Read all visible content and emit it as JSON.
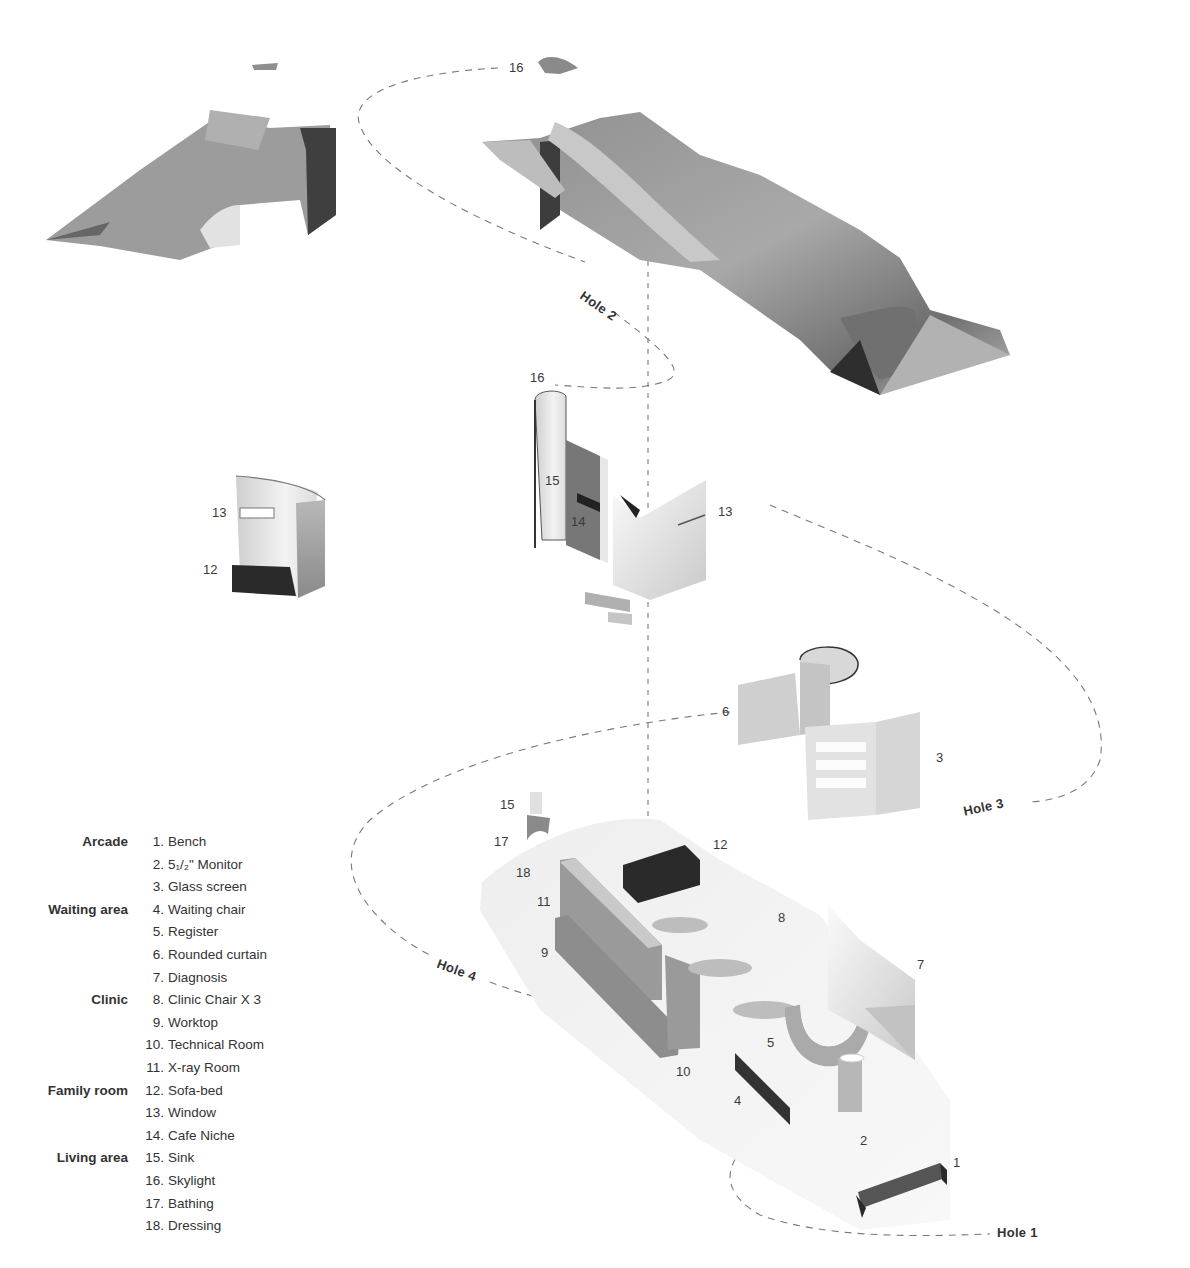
{
  "diagram": {
    "type": "exploded axonometric architectural diagram",
    "colors": {
      "background": "#ffffff",
      "surface_mid": "#9a9a9a",
      "surface_dark": "#3a3a3a",
      "surface_light": "#d8d8d8",
      "floor_light": "#eeeeee",
      "dash_line": "#777777",
      "text": "#333333"
    },
    "holes": [
      {
        "id": "hole1",
        "label": "Hole 1"
      },
      {
        "id": "hole2",
        "label": "Hole 2"
      },
      {
        "id": "hole3",
        "label": "Hole 3"
      },
      {
        "id": "hole4",
        "label": "Hole 4"
      }
    ],
    "callouts": {
      "roof_skylight": "16",
      "skylight_column": "16",
      "sink_upper": "15",
      "cafe_niche": "14",
      "window_right": "13",
      "window_left": "13",
      "sofa_left": "12",
      "curtain": "6",
      "glass_screen": "3",
      "sink_lower": "15",
      "bathing": "17",
      "dressing": "18",
      "sofa_bed": "12",
      "xray": "11",
      "worktop": "9",
      "clinic_chair": "8",
      "diagnosis": "7",
      "register": "5",
      "technical": "10",
      "waiting_chair": "4",
      "monitor": "2",
      "bench": "1"
    }
  },
  "legend": [
    {
      "group": "Arcade",
      "num": "1.",
      "name": "Bench"
    },
    {
      "group": "",
      "num": "2.",
      "name": "5₁/₂\" Monitor"
    },
    {
      "group": "",
      "num": "3.",
      "name": "Glass screen"
    },
    {
      "group": "Waiting area",
      "num": "4.",
      "name": "Waiting chair"
    },
    {
      "group": "",
      "num": "5.",
      "name": "Register"
    },
    {
      "group": "",
      "num": "6.",
      "name": "Rounded curtain"
    },
    {
      "group": "",
      "num": "7.",
      "name": "Diagnosis"
    },
    {
      "group": "Clinic",
      "num": "8.",
      "name": "Clinic Chair X 3"
    },
    {
      "group": "",
      "num": "9.",
      "name": "Worktop"
    },
    {
      "group": "",
      "num": "10.",
      "name": "Technical Room"
    },
    {
      "group": "",
      "num": "11.",
      "name": "X-ray Room"
    },
    {
      "group": "Family room",
      "num": "12.",
      "name": "Sofa-bed"
    },
    {
      "group": "",
      "num": "13.",
      "name": "Window"
    },
    {
      "group": "",
      "num": "14.",
      "name": "Cafe Niche"
    },
    {
      "group": "Living area",
      "num": "15.",
      "name": "Sink"
    },
    {
      "group": "",
      "num": "16.",
      "name": "Skylight"
    },
    {
      "group": "",
      "num": "17.",
      "name": "Bathing"
    },
    {
      "group": "",
      "num": "18.",
      "name": "Dressing"
    }
  ]
}
